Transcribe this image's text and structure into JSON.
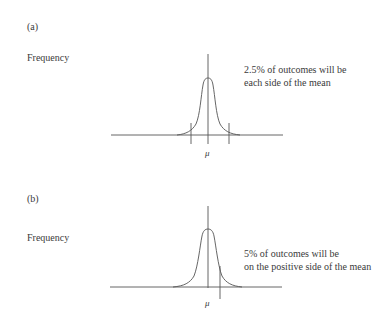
{
  "panels": [
    {
      "label": "(a)",
      "ylabel": "Frequency",
      "mean_label": "μ",
      "annotation": [
        "2.5% of outcomes will be",
        "each side of the mean"
      ],
      "tails": "two-sided"
    },
    {
      "label": "(b)",
      "ylabel": "Frequency",
      "mean_label": "μ",
      "annotation": [
        "5% of outcomes will be",
        "on the positive side of the mean"
      ],
      "tails": "one-sided (positive)"
    }
  ],
  "colors": {
    "line": "#555555",
    "text": "#3a3a3a"
  }
}
